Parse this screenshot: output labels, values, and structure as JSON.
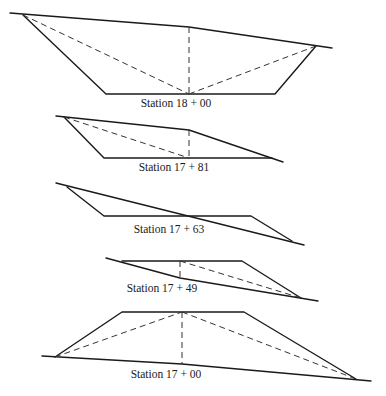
{
  "sections": [
    {
      "id": "18+00",
      "label": "Station 18 + 00",
      "type": "cut",
      "ground_line": [
        [
          10,
          13
        ],
        [
          189,
          27
        ],
        [
          332,
          48
        ]
      ],
      "template": [
        [
          23,
          15
        ],
        [
          106,
          94
        ],
        [
          275,
          94
        ],
        [
          316,
          46
        ]
      ],
      "dashed": [
        [
          [
            23,
            15
          ],
          [
            189,
            94
          ]
        ],
        [
          [
            189,
            27
          ],
          [
            189,
            94
          ]
        ],
        [
          [
            189,
            94
          ],
          [
            316,
            46
          ]
        ]
      ],
      "label_pos": [
        176,
        107
      ]
    },
    {
      "id": "17+81",
      "label": "Station 17 + 81",
      "type": "cut (transition)",
      "ground_line": [
        [
          56,
          116
        ],
        [
          189,
          130
        ],
        [
          283,
          162
        ]
      ],
      "template": [
        [
          64,
          117
        ],
        [
          104,
          158
        ],
        [
          272,
          158
        ]
      ],
      "dashed": [
        [
          [
            64,
            117
          ],
          [
            189,
            158
          ]
        ],
        [
          [
            189,
            130
          ],
          [
            189,
            158
          ]
        ]
      ],
      "label_pos": [
        174,
        171
      ]
    },
    {
      "id": "17+63",
      "label": "Station 17 + 63",
      "type": "mixed cut/fill",
      "ground_line": [
        [
          56,
          183
        ],
        [
          304,
          245
        ]
      ],
      "template": [
        [
          67,
          187
        ],
        [
          104,
          216
        ],
        [
          251,
          216
        ],
        [
          292,
          241
        ]
      ],
      "dashed": [],
      "label_pos": [
        169,
        233
      ]
    },
    {
      "id": "17+49",
      "label": "Station 17 + 49",
      "type": "fill (transition)",
      "ground_line": [
        [
          106,
          258
        ],
        [
          180,
          278
        ],
        [
          318,
          301
        ]
      ],
      "template": [
        [
          122,
          261
        ],
        [
          242,
          261
        ],
        [
          301,
          298
        ]
      ],
      "dashed": [
        [
          [
            180,
            261
          ],
          [
            180,
            278
          ]
        ],
        [
          [
            180,
            261
          ],
          [
            301,
            298
          ]
        ]
      ],
      "label_pos": [
        162,
        292
      ]
    },
    {
      "id": "17+00",
      "label": "Station 17 + 00",
      "type": "fill",
      "ground_line": [
        [
          42,
          356
        ],
        [
          182,
          364
        ],
        [
          371,
          381
        ]
      ],
      "template": [
        [
          55,
          357
        ],
        [
          122,
          312
        ],
        [
          244,
          312
        ],
        [
          356,
          379
        ]
      ],
      "dashed": [
        [
          [
            55,
            357
          ],
          [
            182,
            312
          ]
        ],
        [
          [
            182,
            312
          ],
          [
            182,
            364
          ]
        ],
        [
          [
            182,
            312
          ],
          [
            356,
            379
          ]
        ]
      ],
      "label_pos": [
        166,
        378
      ]
    }
  ]
}
